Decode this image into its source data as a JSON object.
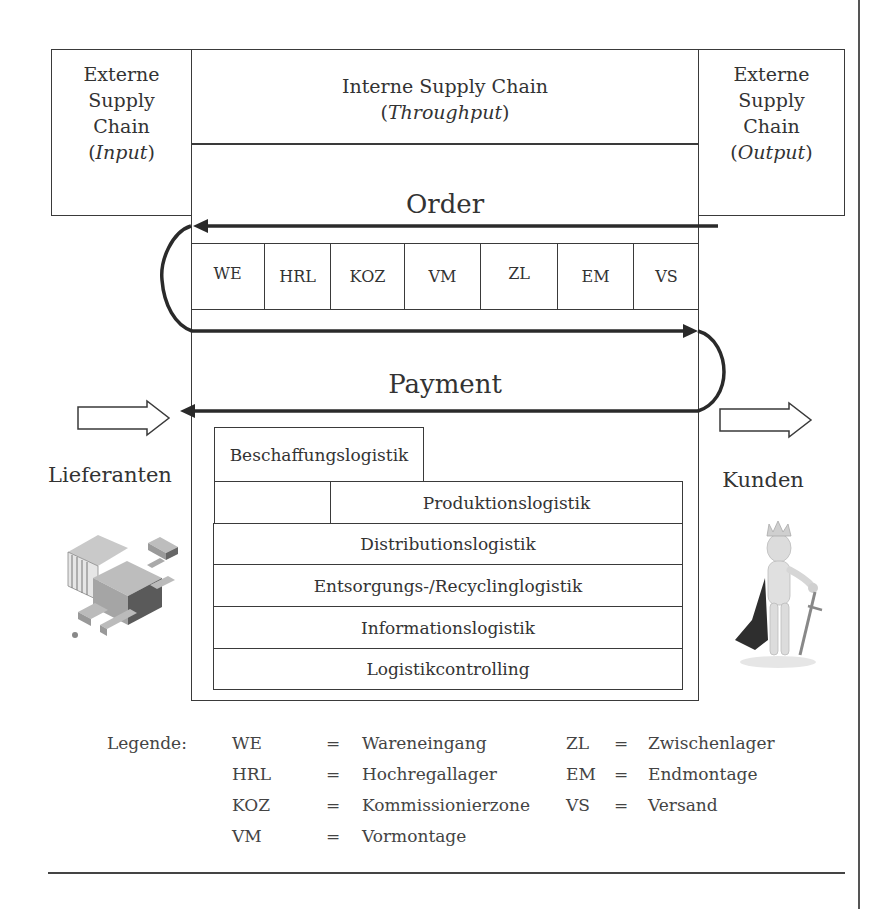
{
  "diagram": {
    "left_box": {
      "line1": "Externe",
      "line2": "Supply",
      "line3": "Chain",
      "line4_open": "(",
      "line4_italic": "Input",
      "line4_close": ")"
    },
    "center_header": {
      "line1": "Interne Supply Chain",
      "line2_open": "(",
      "line2_italic": "Throughput",
      "line2_close": ")"
    },
    "right_box": {
      "line1": "Externe",
      "line2": "Supply",
      "line3": "Chain",
      "line4_open": "(",
      "line4_italic": "Output",
      "line4_close": ")"
    },
    "order_label": "Order",
    "payment_label": "Payment",
    "cells": [
      "WE",
      "HRL",
      "KOZ",
      "VM",
      "ZL",
      "EM",
      "VS"
    ],
    "left_label": "Lieferanten",
    "right_label": "Kunden",
    "logistics": {
      "beschaffung": "Beschaffungslogistik",
      "produktion": "Produktionslogistik",
      "distribution": "Distributionslogistik",
      "entsorgung": "Entsorgungs-/Recyclinglogistik",
      "information": "Informationslogistik",
      "controlling": "Logistikcontrolling"
    },
    "icons": {
      "left_image": "factory-illustration-icon",
      "right_image": "king-figure-icon",
      "left_arrow": "hollow-arrow-right-icon",
      "right_arrow": "hollow-arrow-right-icon"
    }
  },
  "legend": {
    "title": "Legende:",
    "entries_left": [
      {
        "abbr": "WE",
        "eq": "=",
        "text": "Wareneingang"
      },
      {
        "abbr": "HRL",
        "eq": "=",
        "text": "Hochregallager"
      },
      {
        "abbr": "KOZ",
        "eq": "=",
        "text": "Kommissionierzone"
      },
      {
        "abbr": "VM",
        "eq": "=",
        "text": "Vormontage"
      }
    ],
    "entries_right": [
      {
        "abbr": "ZL",
        "eq": "=",
        "text": "Zwischenlager"
      },
      {
        "abbr": "EM",
        "eq": "=",
        "text": "Endmontage"
      },
      {
        "abbr": "VS",
        "eq": "=",
        "text": "Versand"
      }
    ]
  },
  "colors": {
    "line": "#3a3a3a",
    "text": "#333333",
    "background": "#ffffff"
  }
}
